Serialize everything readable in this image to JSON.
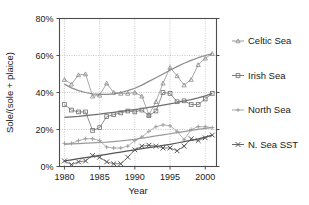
{
  "chart_data": {
    "type": "line",
    "title": "",
    "xlabel": "Year",
    "ylabel": "Sole/(sole + plaice)",
    "xlim": [
      1979.3,
      2001.6
    ],
    "ylim": [
      0,
      80
    ],
    "yunit": "%",
    "grid": true,
    "legend_position": "right",
    "xticks": [
      1980,
      1985,
      1990,
      1995,
      2000
    ],
    "xtick_labels": [
      "1980",
      "1985",
      "1990",
      "1995",
      "2000"
    ],
    "yticks": [
      0,
      20,
      40,
      60,
      80
    ],
    "ytick_labels": [
      "0%",
      "20%",
      "40%",
      "60%",
      "80%"
    ],
    "x": [
      1980,
      1981,
      1982,
      1983,
      1984,
      1985,
      1986,
      1987,
      1988,
      1989,
      1990,
      1991,
      1992,
      1993,
      1994,
      1995,
      1996,
      1997,
      1998,
      1999,
      2000,
      2001
    ],
    "series": [
      {
        "name": "Celtic Sea",
        "marker": "triangle",
        "color": "#8c8c8c",
        "values": [
          47.0,
          44.5,
          49.5,
          50.0,
          38.0,
          38.5,
          45.0,
          40.0,
          39.5,
          39.5,
          40.0,
          38.0,
          28.0,
          35.0,
          45.0,
          53.5,
          49.0,
          44.0,
          47.0,
          55.0,
          58.5,
          61.0
        ],
        "trend": [
          44.5,
          42.5,
          41.0,
          40.0,
          39.3,
          39.0,
          39.0,
          39.3,
          40.0,
          41.0,
          42.3,
          44.0,
          46.0,
          48.0,
          50.0,
          52.0,
          54.0,
          55.8,
          57.4,
          58.8,
          60.0,
          61.0
        ]
      },
      {
        "name": "Irish Sea",
        "marker": "square",
        "color": "#6e6e6e",
        "values": [
          33.5,
          30.5,
          29.5,
          29.5,
          19.5,
          21.0,
          27.0,
          28.0,
          29.0,
          30.0,
          29.5,
          30.5,
          27.5,
          30.0,
          40.0,
          39.5,
          35.0,
          35.5,
          33.5,
          33.5,
          36.5,
          39.5
        ],
        "trend": [
          26.5,
          26.8,
          27.1,
          27.5,
          27.9,
          28.3,
          28.8,
          29.3,
          29.8,
          30.3,
          30.8,
          31.3,
          31.9,
          32.5,
          33.2,
          33.9,
          34.6,
          35.4,
          36.2,
          37.1,
          38.2,
          39.5
        ]
      },
      {
        "name": "North Sea",
        "marker": "plus",
        "color": "#9a9a9a",
        "values": [
          12.5,
          12.5,
          14.0,
          15.0,
          15.0,
          14.0,
          10.5,
          10.0,
          10.0,
          11.0,
          14.0,
          16.0,
          19.0,
          21.5,
          22.5,
          22.0,
          19.0,
          14.5,
          20.0,
          21.5,
          21.5,
          21.0
        ],
        "trend": [
          12.0,
          12.2,
          12.4,
          12.6,
          12.8,
          13.0,
          13.2,
          13.5,
          13.8,
          14.2,
          14.7,
          15.3,
          15.9,
          16.5,
          17.1,
          17.7,
          18.3,
          18.9,
          19.5,
          20.1,
          20.6,
          21.0
        ]
      },
      {
        "name": "N. Sea SST",
        "marker": "x",
        "color": "#555555",
        "values": [
          3.0,
          1.0,
          2.5,
          3.0,
          6.0,
          5.0,
          2.5,
          1.5,
          1.5,
          5.0,
          9.0,
          11.0,
          11.5,
          11.0,
          10.0,
          10.0,
          8.5,
          11.0,
          15.0,
          14.0,
          15.5,
          17.0
        ],
        "trend": [
          3.0,
          3.6,
          4.2,
          4.8,
          5.4,
          6.0,
          6.6,
          7.2,
          7.8,
          8.4,
          9.0,
          9.6,
          10.2,
          10.8,
          11.4,
          12.0,
          12.7,
          13.4,
          14.1,
          14.9,
          15.9,
          17.0
        ]
      }
    ]
  },
  "legend": {
    "items": [
      {
        "label": "Celtic Sea",
        "marker": "triangle-icon"
      },
      {
        "label": "Irish Sea",
        "marker": "square-icon"
      },
      {
        "label": "North Sea",
        "marker": "plus-icon"
      },
      {
        "label": "N. Sea SST",
        "marker": "x-icon"
      }
    ]
  },
  "colors": {
    "axis": "#4d4d4d",
    "grid": "#b0b0b0",
    "text": "#1a1a1a",
    "background": "#ffffff"
  }
}
